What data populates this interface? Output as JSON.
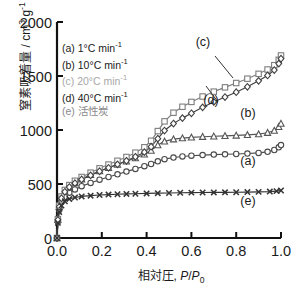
{
  "chart_data": {
    "type": "line",
    "title": "",
    "xlabel": "相対圧, P/P0",
    "ylabel": "窒素吸着量 / cm 3 g-1",
    "xlim": [
      0.0,
      1.0
    ],
    "ylim": [
      0,
      2000
    ],
    "xticks": [
      "0.0",
      "0.2",
      "0.4",
      "0.6",
      "0.8",
      "1.0"
    ],
    "yticks": [
      "0",
      "500",
      "1000",
      "1500",
      "2000"
    ],
    "grid": false,
    "legend_position": "upper-left",
    "series": [
      {
        "name": "(a) 1°C min-1",
        "key": "a",
        "marker": "circle",
        "color": "#4a4a4a",
        "x": [
          0.0,
          0.004,
          0.01,
          0.02,
          0.035,
          0.055,
          0.08,
          0.11,
          0.15,
          0.19,
          0.23,
          0.27,
          0.31,
          0.35,
          0.39,
          0.42,
          0.45,
          0.48,
          0.52,
          0.56,
          0.6,
          0.65,
          0.7,
          0.75,
          0.8,
          0.85,
          0.9,
          0.94,
          0.97,
          0.99,
          1.0
        ],
        "y": [
          0,
          150,
          260,
          330,
          380,
          420,
          450,
          480,
          510,
          540,
          565,
          590,
          615,
          640,
          665,
          685,
          710,
          730,
          745,
          755,
          762,
          768,
          772,
          775,
          778,
          782,
          788,
          798,
          815,
          840,
          860
        ]
      },
      {
        "name": "(b) 10°C min-1",
        "key": "b",
        "marker": "triangle",
        "color": "#555555",
        "x": [
          0.0,
          0.004,
          0.01,
          0.02,
          0.035,
          0.055,
          0.08,
          0.11,
          0.15,
          0.19,
          0.23,
          0.27,
          0.31,
          0.35,
          0.39,
          0.42,
          0.45,
          0.48,
          0.52,
          0.56,
          0.6,
          0.65,
          0.7,
          0.75,
          0.8,
          0.85,
          0.9,
          0.94,
          0.97,
          0.99,
          1.0
        ],
        "y": [
          0,
          170,
          290,
          370,
          430,
          475,
          510,
          545,
          585,
          620,
          650,
          680,
          710,
          740,
          775,
          810,
          860,
          895,
          915,
          925,
          932,
          938,
          942,
          946,
          950,
          955,
          962,
          975,
          995,
          1030,
          1060
        ]
      },
      {
        "name": "(c) 20°C min-1",
        "key": "c",
        "marker": "square",
        "color": "#7d7d7d",
        "x": [
          0.0,
          0.004,
          0.01,
          0.02,
          0.035,
          0.055,
          0.08,
          0.11,
          0.15,
          0.19,
          0.23,
          0.27,
          0.31,
          0.35,
          0.39,
          0.42,
          0.45,
          0.48,
          0.52,
          0.56,
          0.6,
          0.65,
          0.7,
          0.75,
          0.8,
          0.85,
          0.9,
          0.94,
          0.97,
          0.99,
          1.0
        ],
        "y": [
          0,
          175,
          300,
          385,
          445,
          490,
          530,
          565,
          605,
          645,
          680,
          715,
          750,
          790,
          840,
          900,
          990,
          1080,
          1160,
          1215,
          1260,
          1310,
          1355,
          1395,
          1435,
          1475,
          1520,
          1560,
          1600,
          1650,
          1690
        ]
      },
      {
        "name": "(d) 40°C min-1",
        "key": "d",
        "marker": "diamond",
        "color": "#3f3f3f",
        "x": [
          0.0,
          0.004,
          0.01,
          0.02,
          0.035,
          0.055,
          0.08,
          0.11,
          0.15,
          0.19,
          0.23,
          0.27,
          0.31,
          0.35,
          0.39,
          0.42,
          0.45,
          0.48,
          0.52,
          0.56,
          0.6,
          0.65,
          0.7,
          0.75,
          0.8,
          0.85,
          0.9,
          0.94,
          0.97,
          0.99,
          1.0
        ],
        "y": [
          0,
          168,
          288,
          368,
          428,
          472,
          508,
          542,
          580,
          618,
          650,
          682,
          715,
          752,
          795,
          845,
          920,
          995,
          1060,
          1110,
          1155,
          1210,
          1260,
          1305,
          1350,
          1400,
          1455,
          1505,
          1555,
          1615,
          1660
        ]
      },
      {
        "name": "(e) 活性炭",
        "key": "e",
        "marker": "x",
        "color": "#333333",
        "x": [
          0.0,
          0.004,
          0.01,
          0.02,
          0.035,
          0.055,
          0.08,
          0.11,
          0.15,
          0.19,
          0.23,
          0.27,
          0.31,
          0.35,
          0.4,
          0.45,
          0.5,
          0.55,
          0.6,
          0.65,
          0.7,
          0.75,
          0.8,
          0.85,
          0.9,
          0.95,
          0.98,
          1.0
        ],
        "y": [
          0,
          140,
          240,
          300,
          340,
          362,
          375,
          385,
          392,
          398,
          402,
          405,
          408,
          410,
          413,
          415,
          417,
          419,
          420,
          421,
          422,
          423,
          424,
          425,
          427,
          430,
          434,
          440
        ]
      }
    ],
    "annotations": [
      {
        "label": "(c)",
        "x": 203,
        "y": 46,
        "leader": [
          [
            215,
            56
          ],
          [
            233,
            78
          ]
        ]
      },
      {
        "label": "(d)",
        "x": 211,
        "y": 104,
        "leader": [
          [
            218,
            102
          ],
          [
            206,
            86
          ]
        ]
      },
      {
        "label": "(b)",
        "x": 248,
        "y": 117
      },
      {
        "label": "(a)",
        "x": 248,
        "y": 165
      },
      {
        "label": "(e)",
        "x": 248,
        "y": 205
      }
    ]
  },
  "legend": {
    "items": [
      {
        "prefix": "(a) 1",
        "deg": "°C min",
        "sup": "-1",
        "color": "#1a1a1a"
      },
      {
        "prefix": "(b) 10",
        "deg": "°C min",
        "sup": "-1",
        "color": "#1a1a1a"
      },
      {
        "prefix": "(c) 20",
        "deg": "°C min",
        "sup": "-1",
        "color": "#a8a8a8"
      },
      {
        "prefix": "(d) 40",
        "deg": "°C min",
        "sup": "-1",
        "color": "#1a1a1a"
      },
      {
        "prefix": "(e) 活性炭",
        "deg": "",
        "sup": "",
        "color": "#8a8a8a"
      }
    ]
  },
  "axis_text": {
    "y_main": "窒素吸着量 / cm",
    "y_sup1": "3",
    "y_mid": " g",
    "y_sup2": "-1",
    "x_main": "相対圧, ",
    "x_italic_p1": "P",
    "x_slash": "/",
    "x_italic_p2": "P",
    "x_sub": "0"
  }
}
